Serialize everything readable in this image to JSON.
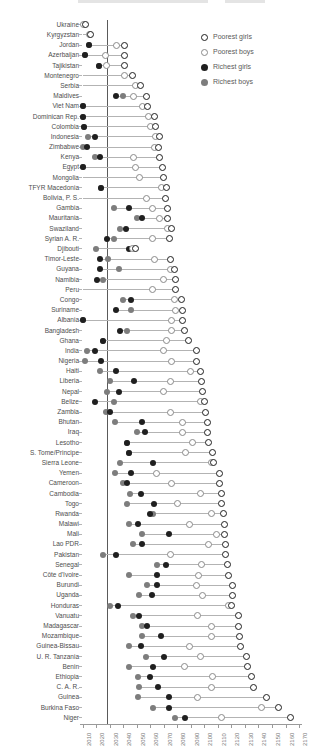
{
  "legend": {
    "items": [
      {
        "label": "Poorest girls",
        "marker": "open-black-circle"
      },
      {
        "label": "Poorest boys",
        "marker": "open-gray-circle"
      },
      {
        "label": "Richest girls",
        "marker": "filled-black-circle"
      },
      {
        "label": "Richest boys",
        "marker": "filled-gray-circle"
      }
    ]
  },
  "colors": {
    "black_series": "#1f1f1f",
    "gray_series": "#7d7d7d",
    "connector": "#b3b3b3",
    "reference_line": "#5a5a5a",
    "label_text": "#4d4d4d",
    "tick_text": "#7a7a7a"
  },
  "chart_data": {
    "type": "scatter",
    "subtype": "dumbbell-dot-plot",
    "xlabel": "",
    "ylabel": "",
    "x_ticks": [
      2010,
      2020,
      2030,
      2040,
      2050,
      2060,
      2070,
      2080,
      2090,
      2100,
      2110,
      2120,
      2130,
      2140,
      2150,
      2160,
      2170
    ],
    "x_range": [
      2010,
      2170
    ],
    "reference_line_year": 2028,
    "legend_position": "top-right",
    "series_keys": [
      "poorest_girls",
      "poorest_boys",
      "richest_girls",
      "richest_boys"
    ],
    "rows": [
      {
        "country": "Ukraine",
        "richest_girls": null,
        "richest_boys": null,
        "poorest_boys": 2011,
        "poorest_girls": 2012
      },
      {
        "country": "Kyrgyzstan",
        "richest_girls": null,
        "richest_boys": null,
        "poorest_boys": 2015,
        "poorest_girls": 2016
      },
      {
        "country": "Jordan",
        "richest_girls": 2015,
        "richest_boys": 2015,
        "poorest_boys": 2035,
        "poorest_girls": 2041
      },
      {
        "country": "Azerbaijan",
        "richest_girls": 2012,
        "richest_boys": 2012,
        "poorest_boys": 2027,
        "poorest_girls": 2041
      },
      {
        "country": "Tajikistan",
        "richest_girls": 2022,
        "richest_boys": 2022,
        "poorest_boys": 2028,
        "poorest_girls": 2041
      },
      {
        "country": "Montenegro",
        "richest_girls": null,
        "richest_boys": null,
        "poorest_boys": 2041,
        "poorest_girls": 2047
      },
      {
        "country": "Serbia",
        "richest_girls": null,
        "richest_boys": null,
        "poorest_boys": 2049,
        "poorest_girls": 2053
      },
      {
        "country": "Maldives",
        "richest_girls": 2035,
        "richest_boys": 2040,
        "poorest_boys": 2048,
        "poorest_girls": 2057
      },
      {
        "country": "Viet Nam",
        "richest_girls": 2010,
        "richest_boys": 2010,
        "poorest_boys": 2054,
        "poorest_girls": 2058
      },
      {
        "country": "Dominican Rep.",
        "richest_girls": 2010,
        "richest_boys": 2010,
        "poorest_boys": 2059,
        "poorest_girls": 2063
      },
      {
        "country": "Colombia",
        "richest_girls": 2011,
        "richest_boys": 2011,
        "poorest_boys": 2060,
        "poorest_girls": 2064
      },
      {
        "country": "Indonesia",
        "richest_girls": 2019,
        "richest_boys": 2014,
        "poorest_boys": 2064,
        "poorest_girls": 2067
      },
      {
        "country": "Zimbabwe",
        "richest_girls": 2013,
        "richest_boys": 2010,
        "poorest_boys": 2063,
        "poorest_girls": 2066
      },
      {
        "country": "Kenya",
        "richest_girls": 2023,
        "richest_boys": 2019,
        "poorest_boys": 2048,
        "poorest_girls": 2067
      },
      {
        "country": "Egypt",
        "richest_girls": 2010,
        "richest_boys": 2010,
        "poorest_boys": 2049,
        "poorest_girls": 2069
      },
      {
        "country": "Mongolia",
        "richest_girls": null,
        "richest_boys": null,
        "poorest_boys": 2052,
        "poorest_girls": 2070
      },
      {
        "country": "TFYR Macedonia",
        "richest_girls": 2024,
        "richest_boys": 2024,
        "poorest_boys": 2068,
        "poorest_girls": 2072
      },
      {
        "country": "Bolivia, P. S.",
        "richest_girls": null,
        "richest_boys": null,
        "poorest_boys": 2057,
        "poorest_girls": 2071
      },
      {
        "country": "Gambia",
        "richest_girls": 2044,
        "richest_boys": 2033,
        "poorest_boys": 2062,
        "poorest_girls": 2073
      },
      {
        "country": "Mauritania",
        "richest_girls": 2054,
        "richest_boys": 2050,
        "poorest_boys": 2067,
        "poorest_girls": 2073
      },
      {
        "country": "Swaziland",
        "richest_girls": 2042,
        "richest_boys": 2038,
        "poorest_boys": 2073,
        "poorest_girls": 2076
      },
      {
        "country": "Syrian A. R.",
        "richest_girls": 2028,
        "richest_boys": 2033,
        "poorest_boys": 2062,
        "poorest_girls": 2074
      },
      {
        "country": "Djibouti",
        "richest_girls": 2044,
        "richest_boys": 2020,
        "poorest_boys": 2047,
        "poorest_girls": 2049
      },
      {
        "country": "Timor-Leste",
        "richest_girls": 2023,
        "richest_boys": 2029,
        "poorest_boys": 2063,
        "poorest_girls": 2075
      },
      {
        "country": "Guyana",
        "richest_girls": 2023,
        "richest_boys": 2037,
        "poorest_boys": 2075,
        "poorest_girls": 2078
      },
      {
        "country": "Namibia",
        "richest_girls": 2021,
        "richest_boys": 2025,
        "poorest_boys": 2070,
        "poorest_girls": 2079
      },
      {
        "country": "Peru",
        "richest_girls": null,
        "richest_boys": null,
        "poorest_boys": 2062,
        "poorest_girls": 2079
      },
      {
        "country": "Congo",
        "richest_girls": 2046,
        "richest_boys": 2040,
        "poorest_boys": 2078,
        "poorest_girls": 2083
      },
      {
        "country": "Suriname",
        "richest_girls": 2035,
        "richest_boys": 2046,
        "poorest_boys": 2079,
        "poorest_girls": 2084
      },
      {
        "country": "Albania",
        "richest_girls": 2010,
        "richest_boys": 2010,
        "poorest_boys": 2076,
        "poorest_girls": 2084
      },
      {
        "country": "Bangladesh",
        "richest_girls": 2038,
        "richest_boys": 2043,
        "poorest_boys": 2076,
        "poorest_girls": 2085
      },
      {
        "country": "Ghana",
        "richest_girls": 2025,
        "richest_boys": 2025,
        "poorest_boys": 2072,
        "poorest_girls": 2088
      },
      {
        "country": "India",
        "richest_girls": 2019,
        "richest_boys": 2013,
        "poorest_boys": 2070,
        "poorest_girls": 2094
      },
      {
        "country": "Nigeria",
        "richest_girls": 2024,
        "richest_boys": 2012,
        "poorest_boys": 2076,
        "poorest_girls": 2094
      },
      {
        "country": "Haiti",
        "richest_girls": 2035,
        "richest_boys": 2023,
        "poorest_boys": 2090,
        "poorest_girls": 2097
      },
      {
        "country": "Liberia",
        "richest_girls": 2048,
        "richest_boys": 2030,
        "poorest_boys": 2075,
        "poorest_girls": 2098
      },
      {
        "country": "Nepal",
        "richest_girls": 2037,
        "richest_boys": 2028,
        "poorest_boys": 2070,
        "poorest_girls": 2099
      },
      {
        "country": "Belize",
        "richest_girls": 2019,
        "richest_boys": 2033,
        "poorest_boys": 2097,
        "poorest_girls": 2100
      },
      {
        "country": "Zambia",
        "richest_girls": 2030,
        "richest_boys": 2027,
        "poorest_boys": 2075,
        "poorest_girls": 2101
      },
      {
        "country": "Bhutan",
        "richest_girls": 2054,
        "richest_boys": 2034,
        "poorest_boys": 2084,
        "poorest_girls": 2102
      },
      {
        "country": "Iraq",
        "richest_girls": 2056,
        "richest_boys": 2050,
        "poorest_boys": 2084,
        "poorest_girls": 2102
      },
      {
        "country": "Lesotho",
        "richest_girls": 2043,
        "richest_boys": 2043,
        "poorest_boys": 2091,
        "poorest_girls": 2103
      },
      {
        "country": "S. Tome/Principe",
        "richest_girls": 2044,
        "richest_boys": 2044,
        "poorest_boys": 2086,
        "poorest_girls": 2106
      },
      {
        "country": "Sierra Leone",
        "richest_girls": 2062,
        "richest_boys": 2038,
        "poorest_boys": 2105,
        "poorest_girls": 2107
      },
      {
        "country": "Yemen",
        "richest_girls": 2046,
        "richest_boys": 2034,
        "poorest_boys": 2065,
        "poorest_girls": 2111
      },
      {
        "country": "Cameroon",
        "richest_girls": 2043,
        "richest_boys": 2040,
        "poorest_boys": 2076,
        "poorest_girls": 2111
      },
      {
        "country": "Cambodia",
        "richest_girls": 2053,
        "richest_boys": 2045,
        "poorest_boys": 2097,
        "poorest_girls": 2113
      },
      {
        "country": "Togo",
        "richest_girls": 2063,
        "richest_boys": 2043,
        "poorest_boys": 2080,
        "poorest_girls": 2113
      },
      {
        "country": "Rwanda",
        "richest_girls": 2060,
        "richest_boys": 2062,
        "poorest_boys": 2105,
        "poorest_girls": 2114
      },
      {
        "country": "Malawi",
        "richest_girls": 2051,
        "richest_boys": 2044,
        "poorest_boys": 2089,
        "poorest_girls": 2115
      },
      {
        "country": "Mali",
        "richest_girls": 2074,
        "richest_boys": 2054,
        "poorest_boys": 2109,
        "poorest_girls": 2115
      },
      {
        "country": "Lao PDR",
        "richest_girls": 2054,
        "richest_boys": 2047,
        "poorest_boys": 2103,
        "poorest_girls": 2116
      },
      {
        "country": "Pakistan",
        "richest_girls": 2035,
        "richest_boys": 2025,
        "poorest_boys": 2075,
        "poorest_girls": 2116
      },
      {
        "country": "Senegal",
        "richest_girls": 2072,
        "richest_boys": 2065,
        "poorest_boys": 2098,
        "poorest_girls": 2117
      },
      {
        "country": "Côte d'Ivoire",
        "richest_girls": 2065,
        "richest_boys": 2044,
        "poorest_boys": 2096,
        "poorest_girls": 2118
      },
      {
        "country": "Burundi",
        "richest_girls": 2065,
        "richest_boys": 2058,
        "poorest_boys": 2094,
        "poorest_girls": 2121
      },
      {
        "country": "Uganda",
        "richest_girls": 2061,
        "richest_boys": 2052,
        "poorest_boys": 2099,
        "poorest_girls": 2121
      },
      {
        "country": "Honduras",
        "richest_girls": 2036,
        "richest_boys": 2030,
        "poorest_boys": 2118,
        "poorest_girls": 2120
      },
      {
        "country": "Vanuatu",
        "richest_girls": 2052,
        "richest_boys": 2047,
        "poorest_boys": 2095,
        "poorest_girls": 2125
      },
      {
        "country": "Madagascar",
        "richest_girls": 2058,
        "richest_boys": 2054,
        "poorest_boys": 2105,
        "poorest_girls": 2125
      },
      {
        "country": "Mozambique",
        "richest_girls": 2068,
        "richest_boys": 2054,
        "poorest_boys": 2105,
        "poorest_girls": 2126
      },
      {
        "country": "Guinea-Bissau",
        "richest_girls": 2053,
        "richest_boys": 2044,
        "poorest_boys": 2089,
        "poorest_girls": 2127
      },
      {
        "country": "U. R. Tanzania",
        "richest_girls": 2070,
        "richest_boys": 2057,
        "poorest_boys": 2097,
        "poorest_girls": 2131
      },
      {
        "country": "Benin",
        "richest_girls": 2062,
        "richest_boys": 2044,
        "poorest_boys": 2085,
        "poorest_girls": 2132
      },
      {
        "country": "Ethiopia",
        "richest_girls": 2060,
        "richest_boys": 2051,
        "poorest_boys": 2106,
        "poorest_girls": 2135
      },
      {
        "country": "C. A. R.",
        "richest_girls": 2066,
        "richest_boys": 2052,
        "poorest_boys": 2105,
        "poorest_girls": 2136
      },
      {
        "country": "Guinea",
        "richest_girls": 2074,
        "richest_boys": 2051,
        "poorest_boys": 2095,
        "poorest_girls": 2146
      },
      {
        "country": "Burkina Faso",
        "richest_girls": 2074,
        "richest_boys": 2062,
        "poorest_boys": 2142,
        "poorest_girls": 2155
      },
      {
        "country": "Niger",
        "richest_girls": 2086,
        "richest_boys": 2078,
        "poorest_boys": 2113,
        "poorest_girls": 2164
      }
    ]
  }
}
